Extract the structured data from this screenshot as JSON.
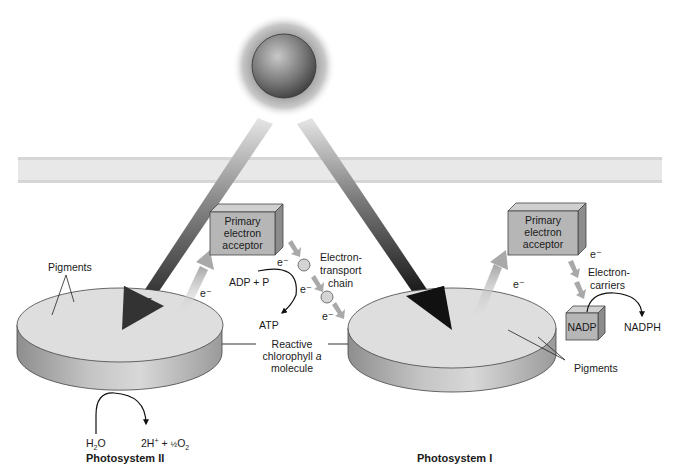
{
  "diagram": {
    "sun": {
      "label": ""
    },
    "membrane": {
      "label": ""
    },
    "photosystem2": {
      "title": "Photosystem II",
      "pigments_label": "Pigments",
      "acceptor_label_lines": [
        "Primary",
        "electron",
        "acceptor"
      ],
      "electron_label": "e⁻",
      "water_split": {
        "reactant": "H₂O",
        "products": "2H⁺ + ½O₂"
      }
    },
    "electron_transport": {
      "label_lines": [
        "Electron-",
        "transport",
        "chain"
      ],
      "electron_labels": [
        "e⁻",
        "e⁻",
        "e⁻"
      ],
      "atp_input": "ADP + P",
      "atp_output": "ATP"
    },
    "reactive_center": {
      "label_lines": [
        "Reactive",
        "chlorophyll a",
        "molecule"
      ]
    },
    "photosystem1": {
      "title": "Photosystem I",
      "pigments_label": "Pigments",
      "acceptor_label_lines": [
        "Primary",
        "electron",
        "acceptor"
      ],
      "electron_label": "e⁻",
      "carriers_label_lines": [
        "Electron-",
        "carriers"
      ],
      "carrier_electron_label": "e⁻",
      "nadp_label": "NADP",
      "nadph_label": "NADPH"
    },
    "colors": {
      "disk_top": "#dcdcdc",
      "disk_side": "#a8a8a8",
      "box_face": "#b4b4b4",
      "membrane": "#e6e6e6",
      "light_arrow": "#3a3a3a",
      "electron_arrow": "#bdbdbd"
    }
  }
}
